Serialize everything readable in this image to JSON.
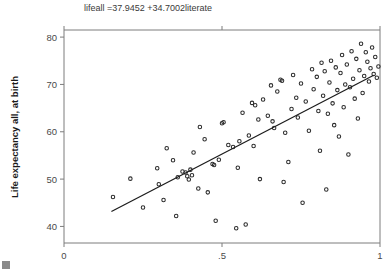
{
  "figure": {
    "title": "lifeall =37.9452 +34.7002literate",
    "width": 388,
    "height": 271,
    "background": "#ffffff"
  },
  "colors": {
    "marker_stroke": "#2b2b2b",
    "fit_line": "#1c1c1c",
    "axis": "#7d7d7d",
    "tick_text": "#4a4a4a",
    "axis_label": "#1a1a1a",
    "title_text": "#3a3a3a"
  },
  "chart_data": {
    "type": "scatter",
    "title": "lifeall =37.9452 +34.7002literate",
    "xlabel": "",
    "ylabel": "Life expectancy all, at birth",
    "xlim": [
      0,
      1.0
    ],
    "ylim": [
      36.5,
      81.5
    ],
    "xticks": [
      0,
      0.5,
      1
    ],
    "xticklabels": [
      "0",
      ".5",
      "1"
    ],
    "yticks": [
      40,
      50,
      60,
      70,
      80
    ],
    "yticklabels": [
      "40",
      "50",
      "60",
      "70",
      "80"
    ],
    "grid": false,
    "legend": null,
    "marker": "open-circle",
    "fit": {
      "label": "lifeall =37.9452 +34.7002literate",
      "intercept": 37.9452,
      "slope": 34.7002,
      "x_start": 0.15,
      "x_end": 0.98
    },
    "series": [
      {
        "name": "countries",
        "points": [
          [
            0.155,
            46.2
          ],
          [
            0.21,
            50.1
          ],
          [
            0.25,
            44.0
          ],
          [
            0.295,
            52.3
          ],
          [
            0.3,
            48.9
          ],
          [
            0.315,
            45.6
          ],
          [
            0.325,
            56.5
          ],
          [
            0.345,
            54.0
          ],
          [
            0.355,
            42.2
          ],
          [
            0.36,
            50.4
          ],
          [
            0.375,
            51.6
          ],
          [
            0.385,
            51.4
          ],
          [
            0.39,
            50.6
          ],
          [
            0.395,
            49.9
          ],
          [
            0.4,
            52.0
          ],
          [
            0.405,
            50.8
          ],
          [
            0.41,
            55.6
          ],
          [
            0.425,
            48.0
          ],
          [
            0.43,
            61.0
          ],
          [
            0.445,
            58.4
          ],
          [
            0.455,
            47.2
          ],
          [
            0.47,
            53.2
          ],
          [
            0.475,
            53.0
          ],
          [
            0.48,
            41.2
          ],
          [
            0.49,
            54.1
          ],
          [
            0.5,
            61.8
          ],
          [
            0.505,
            62.0
          ],
          [
            0.52,
            57.2
          ],
          [
            0.535,
            56.8
          ],
          [
            0.545,
            39.6
          ],
          [
            0.55,
            52.4
          ],
          [
            0.555,
            58.0
          ],
          [
            0.565,
            64.0
          ],
          [
            0.575,
            40.4
          ],
          [
            0.585,
            59.2
          ],
          [
            0.595,
            66.1
          ],
          [
            0.6,
            57.0
          ],
          [
            0.605,
            65.6
          ],
          [
            0.615,
            62.6
          ],
          [
            0.62,
            50.0
          ],
          [
            0.63,
            66.8
          ],
          [
            0.645,
            63.4
          ],
          [
            0.655,
            69.8
          ],
          [
            0.66,
            62.2
          ],
          [
            0.665,
            60.8
          ],
          [
            0.675,
            68.5
          ],
          [
            0.685,
            71.0
          ],
          [
            0.69,
            70.8
          ],
          [
            0.695,
            49.4
          ],
          [
            0.7,
            59.8
          ],
          [
            0.71,
            53.6
          ],
          [
            0.72,
            64.8
          ],
          [
            0.725,
            72.0
          ],
          [
            0.735,
            67.2
          ],
          [
            0.74,
            63.0
          ],
          [
            0.75,
            70.2
          ],
          [
            0.755,
            45.0
          ],
          [
            0.765,
            66.4
          ],
          [
            0.775,
            60.2
          ],
          [
            0.785,
            73.2
          ],
          [
            0.79,
            69.0
          ],
          [
            0.8,
            71.6
          ],
          [
            0.805,
            64.4
          ],
          [
            0.81,
            56.0
          ],
          [
            0.815,
            74.6
          ],
          [
            0.82,
            67.6
          ],
          [
            0.825,
            72.8
          ],
          [
            0.83,
            47.8
          ],
          [
            0.835,
            63.8
          ],
          [
            0.84,
            70.4
          ],
          [
            0.845,
            75.0
          ],
          [
            0.85,
            66.0
          ],
          [
            0.855,
            61.4
          ],
          [
            0.86,
            73.6
          ],
          [
            0.865,
            68.8
          ],
          [
            0.87,
            59.0
          ],
          [
            0.875,
            72.4
          ],
          [
            0.88,
            76.2
          ],
          [
            0.885,
            65.2
          ],
          [
            0.89,
            70.0
          ],
          [
            0.895,
            74.2
          ],
          [
            0.9,
            55.2
          ],
          [
            0.905,
            69.4
          ],
          [
            0.91,
            77.0
          ],
          [
            0.915,
            71.2
          ],
          [
            0.92,
            67.0
          ],
          [
            0.925,
            75.4
          ],
          [
            0.93,
            62.8
          ],
          [
            0.935,
            73.0
          ],
          [
            0.94,
            78.6
          ],
          [
            0.945,
            68.2
          ],
          [
            0.95,
            71.8
          ],
          [
            0.955,
            76.8
          ],
          [
            0.96,
            74.8
          ],
          [
            0.965,
            70.6
          ],
          [
            0.97,
            73.4
          ],
          [
            0.975,
            77.8
          ],
          [
            0.98,
            72.2
          ],
          [
            0.985,
            75.8
          ],
          [
            0.99,
            71.4
          ],
          [
            0.995,
            73.8
          ]
        ]
      }
    ]
  }
}
